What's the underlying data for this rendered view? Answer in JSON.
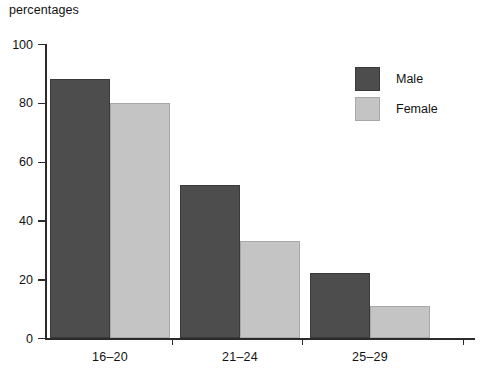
{
  "chart_data": {
    "type": "bar",
    "title": "percentages",
    "xlabel": "",
    "ylabel": "",
    "categories": [
      "16–20",
      "21–24",
      "25–29"
    ],
    "series": [
      {
        "name": "Male",
        "values": [
          88,
          52,
          22
        ],
        "color": "#4d4d4d"
      },
      {
        "name": "Female",
        "values": [
          80,
          33,
          11
        ],
        "color": "#c4c4c4"
      }
    ],
    "ylim": [
      0,
      100
    ],
    "yticks": [
      0,
      20,
      40,
      60,
      80,
      100
    ],
    "ytick_labels": [
      "0",
      "20",
      "40",
      "60",
      "80",
      "100"
    ],
    "grid": false,
    "legend_position": "top-right",
    "legend_entries": [
      "Male",
      "Female"
    ]
  },
  "legend": {
    "items": [
      {
        "label": "Male",
        "swatch": "male-swatch"
      },
      {
        "label": "Female",
        "swatch": "female-swatch"
      }
    ]
  }
}
